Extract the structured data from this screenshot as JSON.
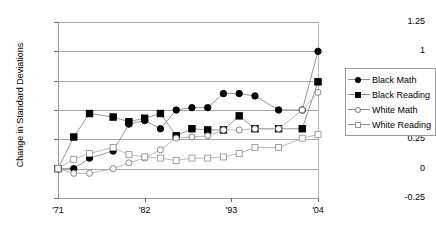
{
  "chart_data": {
    "type": "line",
    "title": "",
    "xlabel": "",
    "ylabel": "Change in Standard Deviations",
    "ylim": [
      -0.25,
      1.25
    ],
    "yticks": [
      1.25,
      1,
      0.75,
      0.5,
      0.25,
      0,
      -0.25
    ],
    "ytick_labels": [
      "1.25",
      "1",
      "0.75",
      "0.5",
      "0.25",
      "0",
      "-0.25"
    ],
    "xtick_labels": [
      "'71",
      "'82",
      "'93",
      "'04"
    ],
    "xtick_values": [
      1971,
      1982,
      1993,
      2004
    ],
    "grid": true,
    "legend_position": "right",
    "x": [
      1971,
      1973,
      1975,
      1978,
      1980,
      1982,
      1984,
      1986,
      1988,
      1990,
      1992,
      1994,
      1996,
      1999,
      2002,
      2004
    ],
    "series": [
      {
        "name": "Black Math",
        "marker": "filled-circle",
        "color": "#000000",
        "values": [
          0.0,
          0.0,
          0.09,
          0.15,
          0.38,
          0.41,
          0.34,
          0.5,
          0.52,
          0.52,
          0.64,
          0.64,
          0.62,
          0.5,
          0.5,
          1.0
        ]
      },
      {
        "name": "Black Reading",
        "marker": "filled-square",
        "color": "#000000",
        "values": [
          0.0,
          0.27,
          0.47,
          0.44,
          0.4,
          0.43,
          0.47,
          0.28,
          0.34,
          0.33,
          0.33,
          0.45,
          0.34,
          0.34,
          0.34,
          0.74
        ]
      },
      {
        "name": "White Math",
        "marker": "open-circle",
        "color": "#808080",
        "values": [
          0.0,
          -0.04,
          -0.04,
          0.0,
          0.05,
          0.09,
          0.16,
          0.26,
          0.27,
          0.28,
          0.33,
          0.33,
          0.34,
          0.34,
          0.5,
          0.65
        ]
      },
      {
        "name": "White Reading",
        "marker": "open-square",
        "color": "#999999",
        "values": [
          0.0,
          0.08,
          0.13,
          0.18,
          0.12,
          0.1,
          0.09,
          0.07,
          0.09,
          0.09,
          0.1,
          0.13,
          0.18,
          0.18,
          0.26,
          0.29
        ]
      }
    ]
  },
  "legend": {
    "items": [
      {
        "label": "Black Math",
        "marker": "filled-circle"
      },
      {
        "label": "Black Reading",
        "marker": "filled-square"
      },
      {
        "label": "White Math",
        "marker": "open-circle"
      },
      {
        "label": "White Reading",
        "marker": "open-square"
      }
    ]
  }
}
